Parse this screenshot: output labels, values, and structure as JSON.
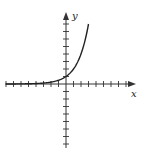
{
  "chart_data": {
    "type": "line",
    "title": "",
    "xlabel": "x",
    "ylabel": "y",
    "function": "y = 2^x",
    "xlim": [
      -8,
      9
    ],
    "ylim": [
      -8,
      9
    ],
    "x_ticks": [
      -8,
      -7,
      -6,
      -5,
      -4,
      -3,
      -2,
      -1,
      1,
      2,
      3,
      4,
      5,
      6,
      7,
      8
    ],
    "y_ticks": [
      -8,
      -7,
      -6,
      -5,
      -4,
      -3,
      -2,
      -1,
      1,
      2,
      3,
      4,
      5,
      6,
      7,
      8
    ],
    "tick_labels_shown": false,
    "grid": false,
    "legend": null,
    "series": [
      {
        "name": "exponential curve",
        "x": [
          -8,
          -7,
          -6,
          -5,
          -4,
          -3,
          -2,
          -1,
          0,
          1,
          2,
          3
        ],
        "y": [
          0.004,
          0.008,
          0.016,
          0.031,
          0.063,
          0.125,
          0.25,
          0.5,
          1,
          2,
          4,
          8
        ]
      }
    ],
    "colors": {
      "axis": "#333333",
      "curve": "#222222",
      "background": "#ffffff"
    }
  },
  "labels": {
    "x_axis": "x",
    "y_axis": "y"
  }
}
